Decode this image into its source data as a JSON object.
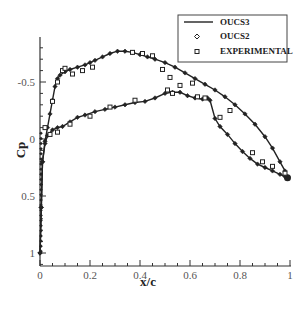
{
  "chart_data": {
    "type": "line",
    "title": "",
    "xlabel": "x/c",
    "ylabel": "Cp",
    "xlim": [
      0,
      1
    ],
    "ylim": [
      -0.85,
      1.12
    ],
    "y_inverted": true,
    "x_ticks": [
      0,
      0.2,
      0.4,
      0.6,
      0.8,
      1
    ],
    "x_tick_labels": [
      "0",
      "0.2",
      "0.4",
      "0.6",
      "0.8",
      "1"
    ],
    "y_ticks": [
      -0.5,
      0,
      0.5,
      1
    ],
    "y_tick_labels": [
      "-0.5",
      "0",
      "0.5",
      "1"
    ],
    "grid": false,
    "legend_position": "upper right",
    "legend": [
      "OUCS3",
      "OUCS2",
      "EXPERIMENTAL"
    ],
    "series": [
      {
        "name": "OUCS3",
        "style": "solid-line",
        "upper_surface": {
          "x": [
            0.0,
            0.005,
            0.01,
            0.02,
            0.03,
            0.04,
            0.05,
            0.06,
            0.07,
            0.08,
            0.1,
            0.12,
            0.15,
            0.18,
            0.2,
            0.22,
            0.25,
            0.28,
            0.31,
            0.34,
            0.37,
            0.4,
            0.43,
            0.46,
            0.5,
            0.54,
            0.58,
            0.62,
            0.66,
            0.7,
            0.74,
            0.78,
            0.82,
            0.86,
            0.9,
            0.93,
            0.96,
            0.98,
            0.99
          ],
          "y": [
            1.0,
            0.6,
            0.2,
            0.02,
            -0.1,
            -0.22,
            -0.34,
            -0.46,
            -0.53,
            -0.56,
            -0.59,
            -0.61,
            -0.63,
            -0.65,
            -0.67,
            -0.69,
            -0.72,
            -0.75,
            -0.77,
            -0.77,
            -0.76,
            -0.74,
            -0.72,
            -0.7,
            -0.67,
            -0.63,
            -0.58,
            -0.53,
            -0.48,
            -0.43,
            -0.37,
            -0.3,
            -0.22,
            -0.13,
            -0.02,
            0.08,
            0.2,
            0.28,
            0.34
          ]
        },
        "lower_surface": {
          "x": [
            0.0,
            0.005,
            0.01,
            0.02,
            0.03,
            0.05,
            0.07,
            0.09,
            0.12,
            0.15,
            0.18,
            0.22,
            0.26,
            0.3,
            0.34,
            0.38,
            0.42,
            0.46,
            0.5,
            0.53,
            0.56,
            0.59,
            0.62,
            0.65,
            0.67,
            0.68,
            0.7,
            0.72,
            0.75,
            0.78,
            0.81,
            0.84,
            0.87,
            0.9,
            0.93,
            0.96,
            0.98,
            0.99
          ],
          "y": [
            1.0,
            0.6,
            0.2,
            0.04,
            -0.03,
            -0.08,
            -0.1,
            -0.11,
            -0.15,
            -0.19,
            -0.21,
            -0.24,
            -0.26,
            -0.28,
            -0.3,
            -0.32,
            -0.33,
            -0.36,
            -0.4,
            -0.41,
            -0.41,
            -0.38,
            -0.36,
            -0.35,
            -0.36,
            -0.34,
            -0.18,
            -0.11,
            -0.04,
            0.04,
            0.11,
            0.17,
            0.22,
            0.25,
            0.28,
            0.31,
            0.33,
            0.34
          ]
        }
      },
      {
        "name": "OUCS2",
        "style": "diamond-markers",
        "note": "Nearly coincident with OUCS3 curve (markers along the line)"
      },
      {
        "name": "EXPERIMENTAL",
        "style": "square-markers",
        "x": [
          0.02,
          0.05,
          0.07,
          0.09,
          0.1,
          0.13,
          0.17,
          0.21,
          0.37,
          0.41,
          0.45,
          0.49,
          0.52,
          0.56,
          0.61,
          0.04,
          0.07,
          0.12,
          0.2,
          0.28,
          0.38,
          0.51,
          0.53,
          0.63,
          0.66,
          0.72,
          0.76,
          0.85,
          0.89,
          0.93,
          0.98
        ],
        "y": [
          -0.1,
          -0.33,
          -0.5,
          -0.6,
          -0.62,
          -0.57,
          -0.6,
          -0.63,
          -0.76,
          -0.75,
          -0.73,
          -0.61,
          -0.54,
          -0.47,
          -0.49,
          -0.04,
          -0.06,
          -0.13,
          -0.2,
          -0.28,
          -0.34,
          -0.43,
          -0.4,
          -0.37,
          -0.36,
          -0.19,
          -0.25,
          0.12,
          0.2,
          0.24,
          0.3
        ]
      }
    ]
  },
  "legend": {
    "items": [
      {
        "label": "OUCS3",
        "symbol": "line"
      },
      {
        "label": "OUCS2",
        "symbol": "diamond"
      },
      {
        "label": "EXPERIMENTAL",
        "symbol": "square"
      }
    ]
  },
  "axes": {
    "xlabel": "x/c",
    "ylabel": "Cp"
  }
}
